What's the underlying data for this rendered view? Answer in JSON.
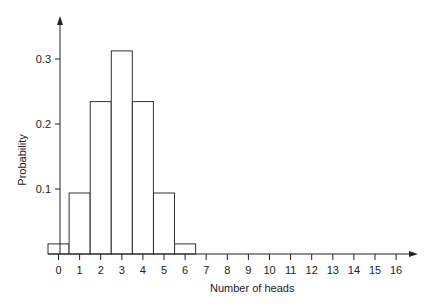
{
  "chart_data": {
    "type": "bar",
    "title": "",
    "xlabel": "Number of heads",
    "ylabel": "Probability",
    "categories": [
      "0",
      "1",
      "2",
      "3",
      "4",
      "5",
      "6",
      "7",
      "8",
      "9",
      "10",
      "11",
      "12",
      "13",
      "14",
      "15",
      "16"
    ],
    "values": [
      0.0156,
      0.0938,
      0.2344,
      0.3125,
      0.2344,
      0.0938,
      0.0156,
      0,
      0,
      0,
      0,
      0,
      0,
      0,
      0,
      0,
      0
    ],
    "yticks": [
      "0.1",
      "0.2",
      "0.3"
    ],
    "ylim": [
      0,
      0.36
    ],
    "grid": false,
    "legend": null
  }
}
